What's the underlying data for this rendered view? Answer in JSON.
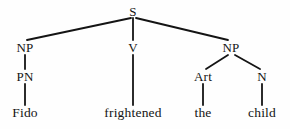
{
  "figure": {
    "kind": "syntax-tree-diagram",
    "sentence": "Fido frightened the child",
    "background_color": "#fefefe",
    "line_color": "#141414",
    "text_color": "#141414"
  },
  "nodes": {
    "s": {
      "label": "S",
      "x": 133,
      "y": 11
    },
    "np_subject": {
      "label": "NP",
      "x": 25,
      "y": 47
    },
    "v": {
      "label": "V",
      "x": 133,
      "y": 47
    },
    "np_object": {
      "label": "NP",
      "x": 231,
      "y": 47
    },
    "pn": {
      "label": "PN",
      "x": 25,
      "y": 76
    },
    "art": {
      "label": "Art",
      "x": 203,
      "y": 76
    },
    "n": {
      "label": "N",
      "x": 262,
      "y": 76
    },
    "fido": {
      "label": "Fido",
      "x": 25,
      "y": 113
    },
    "frightened": {
      "label": "frightened",
      "x": 133,
      "y": 113
    },
    "the": {
      "label": "the",
      "x": 203,
      "y": 113
    },
    "child": {
      "label": "child",
      "x": 262,
      "y": 113
    }
  },
  "edges": [
    {
      "name": "s-to-np-subject",
      "from": "s",
      "to": "np_subject",
      "x1": 131,
      "y1": 18,
      "x2": 27,
      "y2": 40
    },
    {
      "name": "s-to-v",
      "from": "s",
      "to": "v",
      "x1": 133,
      "y1": 18,
      "x2": 133,
      "y2": 40
    },
    {
      "name": "s-to-np-object",
      "from": "s",
      "to": "np_object",
      "x1": 136,
      "y1": 18,
      "x2": 228,
      "y2": 40
    },
    {
      "name": "np-subject-to-pn",
      "from": "np_subject",
      "to": "pn",
      "x1": 25,
      "y1": 55,
      "x2": 25,
      "y2": 69
    },
    {
      "name": "pn-to-fido",
      "from": "pn",
      "to": "fido",
      "x1": 25,
      "y1": 84,
      "x2": 25,
      "y2": 105
    },
    {
      "name": "v-to-frightened",
      "from": "v",
      "to": "frightened",
      "x1": 133,
      "y1": 55,
      "x2": 133,
      "y2": 105
    },
    {
      "name": "np-object-to-art",
      "from": "np_object",
      "to": "art",
      "x1": 228,
      "y1": 55,
      "x2": 206,
      "y2": 69
    },
    {
      "name": "np-object-to-n",
      "from": "np_object",
      "to": "n",
      "x1": 235,
      "y1": 55,
      "x2": 260,
      "y2": 69
    },
    {
      "name": "art-to-the",
      "from": "art",
      "to": "the",
      "x1": 203,
      "y1": 84,
      "x2": 203,
      "y2": 105
    },
    {
      "name": "n-to-child",
      "from": "n",
      "to": "child",
      "x1": 262,
      "y1": 84,
      "x2": 262,
      "y2": 105
    }
  ]
}
